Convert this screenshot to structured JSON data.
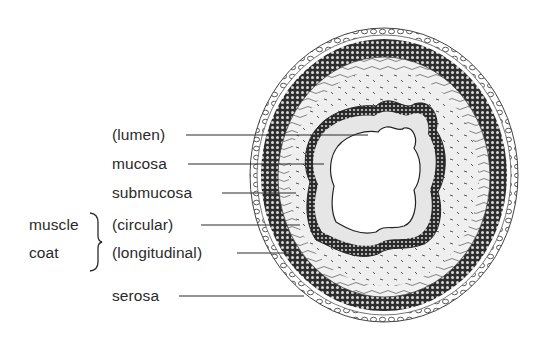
{
  "figure": {
    "colors": {
      "ink": "#2a2a2a",
      "background": "#ffffff",
      "submucosa_fill": "#ececec",
      "muscle_fill": "#3a3a3a"
    }
  },
  "labels": {
    "lumen": "(lumen)",
    "mucosa": "mucosa",
    "submucosa": "submucosa",
    "circular": "(circular)",
    "longitudinal": "(longitudinal)",
    "serosa": "serosa",
    "muscle_coat_line1": "muscle",
    "muscle_coat_line2": "coat"
  }
}
